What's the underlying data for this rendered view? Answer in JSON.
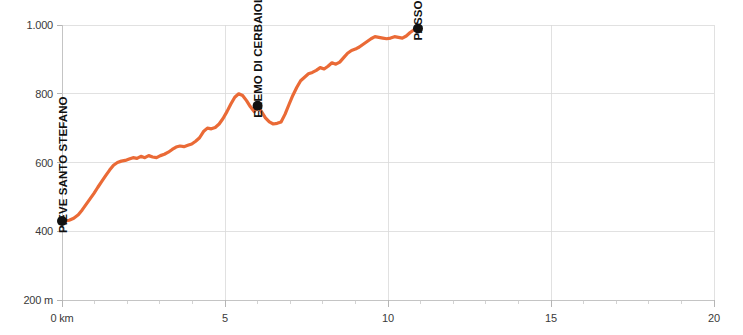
{
  "chart_data": {
    "type": "line",
    "title": "",
    "subtitle": "",
    "xlabel": "",
    "ylabel": "",
    "xlim": [
      0,
      20
    ],
    "ylim": [
      200,
      1000
    ],
    "grid": true,
    "legend": "none",
    "line_color": "#EA6A36",
    "marker_color": "#111111",
    "x_unit": "km",
    "y_unit": "m",
    "x_ticks": [
      0,
      5,
      10,
      15,
      20
    ],
    "x_tick_labels": [
      "0 km",
      "5",
      "10",
      "15",
      "20"
    ],
    "x_minor_tick_step": 1,
    "y_ticks": [
      200,
      400,
      600,
      800,
      1000
    ],
    "y_tick_labels": [
      "200 m",
      "400",
      "600",
      "800",
      "1.000"
    ],
    "series": [
      {
        "name": "elevation-profile",
        "x": [
          0.0,
          0.1,
          0.22,
          0.36,
          0.5,
          0.62,
          0.74,
          0.86,
          0.98,
          1.1,
          1.22,
          1.34,
          1.46,
          1.58,
          1.7,
          1.82,
          1.94,
          2.06,
          2.18,
          2.3,
          2.42,
          2.54,
          2.66,
          2.78,
          2.9,
          3.02,
          3.14,
          3.26,
          3.38,
          3.5,
          3.62,
          3.74,
          3.86,
          3.98,
          4.1,
          4.22,
          4.34,
          4.46,
          4.58,
          4.7,
          4.82,
          4.94,
          5.06,
          5.18,
          5.3,
          5.42,
          5.54,
          5.66,
          5.78,
          5.9,
          6.0,
          6.12,
          6.24,
          6.36,
          6.48,
          6.6,
          6.72,
          6.84,
          6.96,
          7.08,
          7.2,
          7.32,
          7.44,
          7.56,
          7.68,
          7.8,
          7.92,
          8.04,
          8.16,
          8.28,
          8.4,
          8.52,
          8.64,
          8.76,
          8.88,
          9.0,
          9.12,
          9.24,
          9.36,
          9.48,
          9.6,
          9.72,
          9.84,
          9.96,
          10.08,
          10.2,
          10.32,
          10.44,
          10.56,
          10.68,
          10.8,
          10.92
        ],
        "values": [
          430,
          430,
          432,
          438,
          448,
          462,
          478,
          494,
          510,
          528,
          545,
          562,
          578,
          592,
          600,
          604,
          606,
          610,
          614,
          612,
          618,
          614,
          620,
          616,
          614,
          620,
          624,
          630,
          638,
          645,
          648,
          646,
          650,
          654,
          662,
          672,
          690,
          700,
          698,
          702,
          712,
          728,
          748,
          770,
          790,
          800,
          795,
          780,
          762,
          748,
          765,
          748,
          730,
          718,
          712,
          714,
          718,
          740,
          768,
          795,
          818,
          838,
          848,
          858,
          862,
          868,
          876,
          872,
          880,
          890,
          886,
          892,
          905,
          918,
          926,
          930,
          936,
          944,
          952,
          960,
          966,
          964,
          962,
          960,
          962,
          966,
          964,
          962,
          968,
          978,
          986,
          990
        ]
      }
    ],
    "annotations": [
      {
        "label": "PIEVE SANTO STEFANO",
        "x": 0.0,
        "y": 430,
        "marker": true
      },
      {
        "label": "EREMO DI  CERBAIOLO",
        "x": 6.0,
        "y": 765,
        "marker": true
      },
      {
        "label": "PASSO DI VIAMAGGIO",
        "x": 10.92,
        "y": 990,
        "marker": true
      }
    ]
  }
}
